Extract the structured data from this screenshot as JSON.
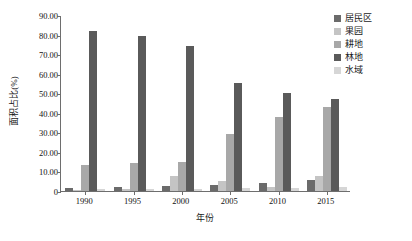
{
  "chart_data": {
    "type": "bar",
    "title": "",
    "subtitle": "",
    "xlabel": "年份",
    "ylabel": "面积占比(%)",
    "categories": [
      "1990",
      "1995",
      "2000",
      "2005",
      "2010",
      "2015"
    ],
    "ylim": [
      0,
      90
    ],
    "ytick_values": [
      0,
      10,
      20,
      30,
      40,
      50,
      60,
      70,
      80,
      90
    ],
    "ytick_labels": [
      "0",
      "10.00",
      "20.00",
      "30.00",
      "40.00",
      "50.00",
      "60.00",
      "70.00",
      "80.00",
      "90.00"
    ],
    "grid": false,
    "legend_position": "right-top",
    "series": [
      {
        "name": "居民区",
        "color": "#6b6b6b",
        "values": [
          1.6,
          2.2,
          2.8,
          3.2,
          4.2,
          5.8
        ]
      },
      {
        "name": "果园",
        "color": "#c4c4c4",
        "values": [
          0.6,
          0.9,
          7.8,
          5.2,
          1.8,
          7.8
        ]
      },
      {
        "name": "耕地",
        "color": "#a8a8a8",
        "values": [
          13.4,
          14.2,
          15.0,
          29.0,
          37.8,
          43.0
        ]
      },
      {
        "name": "林地",
        "color": "#5a5a5a",
        "values": [
          82.0,
          79.5,
          74.0,
          55.0,
          50.2,
          47.2
        ]
      },
      {
        "name": "水域",
        "color": "#d6d6d6",
        "values": [
          0.8,
          1.0,
          1.2,
          1.4,
          1.6,
          1.8
        ]
      }
    ]
  }
}
